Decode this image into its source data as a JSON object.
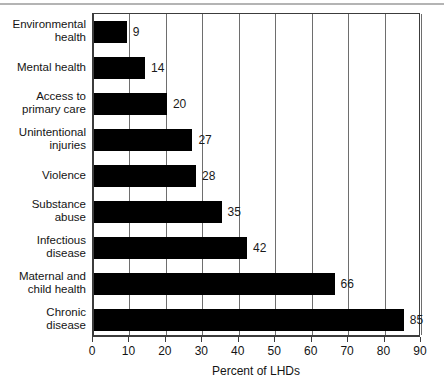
{
  "chart_data": {
    "type": "bar",
    "orientation": "horizontal",
    "title": "",
    "xlabel": "Percent of LHDs",
    "ylabel": "",
    "xlim": [
      0,
      90
    ],
    "xticks": [
      0,
      10,
      20,
      30,
      40,
      50,
      60,
      70,
      80,
      90
    ],
    "grid": "vertical",
    "legend": "none",
    "bar_color": "#000000",
    "gridline_color": "#6e6e6e",
    "axis_color": "#3c3c3c",
    "categories": [
      "Environmental health",
      "Mental health",
      "Access to primary care",
      "Unintentional injuries",
      "Violence",
      "Substance abuse",
      "Infectious disease",
      "Maternal and child health",
      "Chronic disease"
    ],
    "values": [
      9,
      14,
      20,
      27,
      28,
      35,
      42,
      66,
      85
    ],
    "data_labels": [
      "9",
      "14",
      "20",
      "27",
      "28",
      "35",
      "42",
      "66",
      "85"
    ]
  },
  "category_label_lines": [
    [
      "Environmental",
      "health"
    ],
    [
      "Mental health"
    ],
    [
      "Access to",
      "primary care"
    ],
    [
      "Unintentional",
      "injuries"
    ],
    [
      "Violence"
    ],
    [
      "Substance",
      "abuse"
    ],
    [
      "Infectious",
      "disease"
    ],
    [
      "Maternal and",
      "child health"
    ],
    [
      "Chronic",
      "disease"
    ]
  ],
  "axis": {
    "x_title": "Percent of LHDs",
    "x_tick_labels": [
      "0",
      "10",
      "20",
      "30",
      "40",
      "50",
      "60",
      "70",
      "80",
      "90"
    ]
  }
}
